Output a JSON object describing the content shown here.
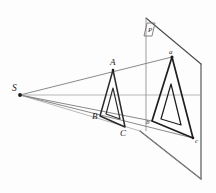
{
  "figure": {
    "background_color": "#fdfdfd",
    "stroke_color": "#2b2b2b",
    "ray_color": "#6b6b6b",
    "plane_color": "#4a4a4a",
    "labels": {
      "center_of_projection": "S",
      "object_vertex_top": "A",
      "object_vertex_left": "B",
      "object_vertex_bottom": "C",
      "image_vertex_top": "a",
      "image_vertex_left": "b",
      "image_vertex_right": "c",
      "plane": "P"
    },
    "geometry": {
      "projection_center": {
        "x": 20,
        "y": 95
      },
      "object_triangle": [
        {
          "name": "A",
          "x": 113,
          "y": 70
        },
        {
          "name": "B",
          "x": 100,
          "y": 116
        },
        {
          "name": "C",
          "x": 125,
          "y": 127
        }
      ],
      "object_inner_triangle": [
        {
          "x": 113,
          "y": 88
        },
        {
          "x": 106,
          "y": 114
        },
        {
          "x": 120,
          "y": 119
        }
      ],
      "image_triangle": [
        {
          "name": "a",
          "x": 172,
          "y": 57
        },
        {
          "name": "b",
          "x": 152,
          "y": 121
        },
        {
          "name": "c",
          "x": 193,
          "y": 138
        }
      ],
      "image_inner_triangle": [
        {
          "x": 171,
          "y": 84
        },
        {
          "x": 161,
          "y": 119
        },
        {
          "x": 181,
          "y": 125
        }
      ],
      "picture_plane_corners": [
        {
          "x": 146,
          "y": 18
        },
        {
          "x": 201,
          "y": 64
        },
        {
          "x": 201,
          "y": 179
        },
        {
          "x": 140,
          "y": 131
        }
      ],
      "vertical_axis": {
        "x": 146,
        "y_top": 18,
        "y_bottom": 131
      }
    }
  }
}
